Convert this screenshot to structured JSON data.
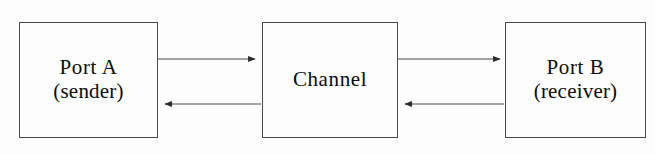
{
  "diagram": {
    "background_color": "#fdfdfd",
    "stroke_color": "#4a4a4a",
    "text_color": "#0b0b0b",
    "nodes": [
      {
        "id": "port-a",
        "primary_label": "Port A",
        "secondary_label": "(sender)"
      },
      {
        "id": "channel",
        "primary_label": "Channel",
        "secondary_label": ""
      },
      {
        "id": "port-b",
        "primary_label": "Port B",
        "secondary_label": "(receiver)"
      }
    ],
    "connectors": [
      {
        "id": "a-to-channel",
        "from": "port-a",
        "to": "channel",
        "direction": "right",
        "label": ""
      },
      {
        "id": "channel-to-a",
        "from": "channel",
        "to": "port-a",
        "direction": "left",
        "label": ""
      },
      {
        "id": "channel-to-b",
        "from": "channel",
        "to": "port-b",
        "direction": "right",
        "label": ""
      },
      {
        "id": "b-to-channel",
        "from": "port-b",
        "to": "channel",
        "direction": "left",
        "label": ""
      }
    ]
  }
}
